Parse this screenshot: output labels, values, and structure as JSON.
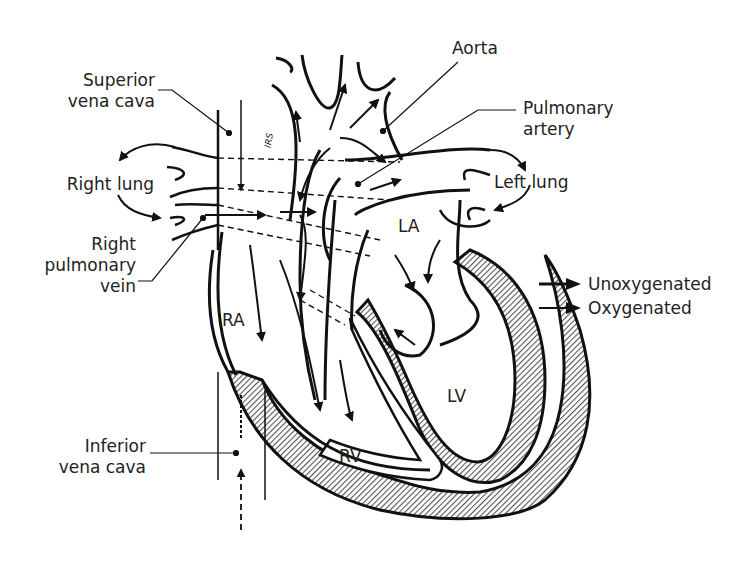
{
  "figure": {
    "labels": {
      "superior_vena_cava": [
        "Superior",
        "vena cava"
      ],
      "right_lung": "Right lung",
      "right_pulmonary_vein": [
        "Right",
        "pulmonary",
        "vein"
      ],
      "inferior_vena_cava": [
        "Inferior",
        "vena cava"
      ],
      "aorta": "Aorta",
      "pulmonary_artery": [
        "Pulmonary",
        "artery"
      ],
      "left_lung": "Left lung",
      "right_atrium": "RA",
      "left_atrium": "LA",
      "right_ventricle": "RV",
      "left_ventricle": "LV",
      "artist_signature": "IRS"
    },
    "legend": [
      {
        "symbol": "arrow-solid",
        "label": "Unoxygenated"
      },
      {
        "symbol": "arrow-solid",
        "label": "Oxygenated"
      }
    ],
    "colors": {
      "ink": "#111111",
      "hatch": "#6b6b6b",
      "background": "#ffffff"
    }
  }
}
